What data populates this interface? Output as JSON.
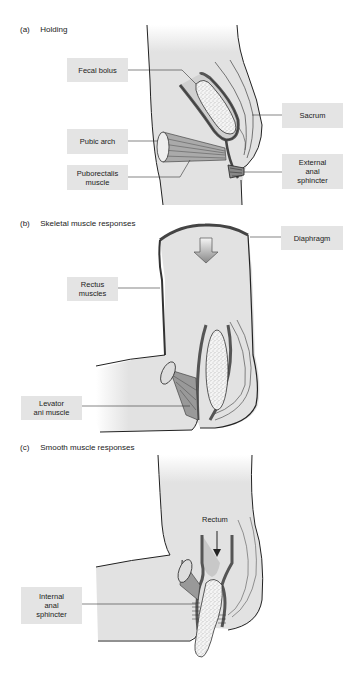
{
  "figure": {
    "panels": [
      {
        "tag": "(a)",
        "title": "Holding",
        "labels": [
          {
            "id": "fecal-bolus",
            "text": "Fecal bolus"
          },
          {
            "id": "sacrum",
            "text": "Sacrum"
          },
          {
            "id": "pubic-arch",
            "text": "Pubic arch"
          },
          {
            "id": "puborectalis-muscle",
            "text": "Puborectalis\nmuscle"
          },
          {
            "id": "external-anal-sphincter",
            "text": "External\nanal\nsphincter"
          }
        ]
      },
      {
        "tag": "(b)",
        "title": "Skeletal muscle responses",
        "labels": [
          {
            "id": "diaphragm",
            "text": "Diaphragm"
          },
          {
            "id": "rectus-muscles",
            "text": "Rectus\nmuscles"
          },
          {
            "id": "levator-ani-muscle",
            "text": "Levator\nani muscle"
          }
        ]
      },
      {
        "tag": "(c)",
        "title": "Smooth muscle responses",
        "labels": [
          {
            "id": "rectum",
            "text": "Rectum"
          },
          {
            "id": "internal-anal-sphincter",
            "text": "Internal\nanal\nsphincter"
          }
        ]
      }
    ],
    "colors": {
      "body_fill": "#e2e2e2",
      "label_fill": "#e4e4e4",
      "outline": "#222222",
      "muscle": "#555555",
      "bolus": "#f2f2f2"
    }
  }
}
